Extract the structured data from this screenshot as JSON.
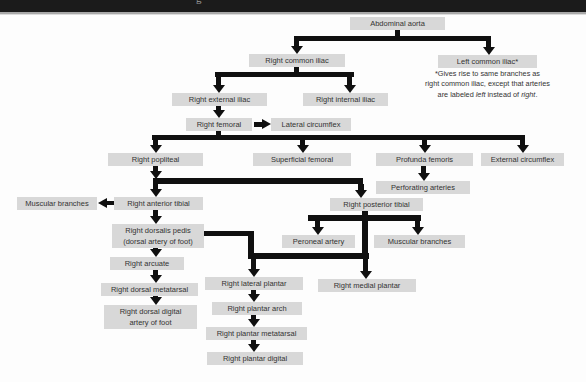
{
  "header": {
    "partial_text": "g"
  },
  "diagram": {
    "nodes": {
      "abdominal_aorta": "Abdominal aorta",
      "right_common_iliac": "Right common iliac",
      "left_common_iliac": "Left common iliac*",
      "right_external_iliac": "Right external iliac",
      "right_internal_iliac": "Right internal iliac",
      "right_femoral": "Right femoral",
      "lateral_circumflex": "Lateral circumflex",
      "right_popliteal": "Right popliteal",
      "superficial_femoral": "Superficial femoral",
      "profunda_femoris": "Profunda femoris",
      "external_circumflex": "External circumflex",
      "perforating_arteries": "Perforating arteries",
      "muscular_branches_left": "Muscular branches",
      "right_anterior_tibial": "Right anterior tibial",
      "right_posterior_tibial": "Right posterior tibial",
      "right_dorsalis_pedis_line1": "Right dorsalis pedis",
      "right_dorsalis_pedis_line2": "(dorsal artery of foot)",
      "peroneal_artery": "Peroneal artery",
      "muscular_branches_right": "Muscular branches",
      "right_arcuate": "Right arcuate",
      "right_lateral_plantar": "Right lateral plantar",
      "right_medial_plantar": "Right medial plantar",
      "right_dorsal_metatarsal": "Right dorsal metatarsal",
      "right_plantar_arch": "Right plantar arch",
      "right_dorsal_digital_line1": "Right dorsal digital",
      "right_dorsal_digital_line2": "artery of foot",
      "right_plantar_metatarsal": "Right plantar metatarsal",
      "right_plantar_digital": "Right plantar digital"
    },
    "note": {
      "line1": "*Gives rise to same branches as",
      "line2": "right common iliac, except that arteries",
      "line3_pre": "are labeled ",
      "line3_italic1": "left",
      "line3_mid": " instead of ",
      "line3_italic2": "right",
      "line3_end": "."
    },
    "colors": {
      "box_bg": "#d8d8d8",
      "box_text": "#333333",
      "line": "#101010",
      "header_bar": "#1b1b1b",
      "background": "#fdfdfd"
    }
  }
}
